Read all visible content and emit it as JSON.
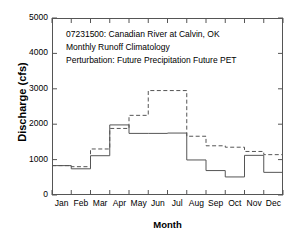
{
  "chart_data": {
    "type": "line",
    "title": "",
    "annotations": [
      "07231500: Canadian River at Calvin, OK",
      "Monthly Runoff Climatology",
      "Perturbation: Future Precipitation Future PET"
    ],
    "xlabel": "Month",
    "ylabel": "Discharge (cfs)",
    "categories": [
      "Jan",
      "Feb",
      "Mar",
      "Apr",
      "May",
      "Jun",
      "Jul",
      "Aug",
      "Sep",
      "Oct",
      "Nov",
      "Dec"
    ],
    "xlim": [
      0,
      12
    ],
    "ylim": [
      0,
      5000
    ],
    "ytick_labels": [
      "0",
      "1000",
      "2000",
      "3000",
      "4000",
      "5000"
    ],
    "ytick_values": [
      0,
      1000,
      2000,
      3000,
      4000,
      5000
    ],
    "grid": false,
    "legend_position": "none",
    "drawstyle": "steps-post",
    "series": [
      {
        "name": "Baseline",
        "style": "solid",
        "color": "#555555",
        "values": [
          830,
          740,
          1110,
          1980,
          1740,
          1740,
          1750,
          990,
          690,
          510,
          1120,
          640
        ]
      },
      {
        "name": "Perturbation: Future Precipitation Future PET",
        "style": "dashed",
        "color": "#555555",
        "values": [
          830,
          800,
          1300,
          1880,
          2250,
          2950,
          2950,
          1660,
          1390,
          1350,
          1230,
          1140
        ]
      }
    ]
  }
}
